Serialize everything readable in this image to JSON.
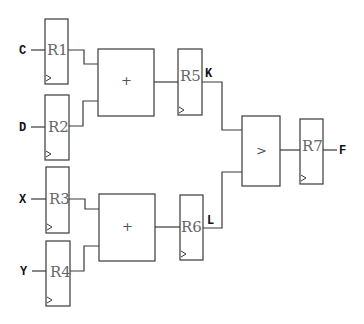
{
  "diagram": {
    "type": "datapath",
    "inputs": [
      {
        "label": "C",
        "to": "R1"
      },
      {
        "label": "D",
        "to": "R2"
      },
      {
        "label": "X",
        "to": "R3"
      },
      {
        "label": "Y",
        "to": "R4"
      }
    ],
    "registers": [
      {
        "id": "R1",
        "label": "R1"
      },
      {
        "id": "R2",
        "label": "R2"
      },
      {
        "id": "R3",
        "label": "R3"
      },
      {
        "id": "R4",
        "label": "R4"
      },
      {
        "id": "R5",
        "label": "R5"
      },
      {
        "id": "R6",
        "label": "R6"
      },
      {
        "id": "R7",
        "label": "R7"
      }
    ],
    "operators": [
      {
        "id": "add1",
        "symbol": "+",
        "inputs": [
          "R1",
          "R2"
        ],
        "output": "R5"
      },
      {
        "id": "add2",
        "symbol": "+",
        "inputs": [
          "R3",
          "R4"
        ],
        "output": "R6"
      },
      {
        "id": "cmp",
        "symbol": ">",
        "inputs": [
          "K",
          "L"
        ],
        "output": "R7"
      }
    ],
    "signals": [
      {
        "label": "K",
        "from": "R5",
        "to": "cmp"
      },
      {
        "label": "L",
        "from": "R6",
        "to": "cmp"
      },
      {
        "label": "F",
        "from": "R7"
      }
    ],
    "clock_symbol": "▷"
  }
}
